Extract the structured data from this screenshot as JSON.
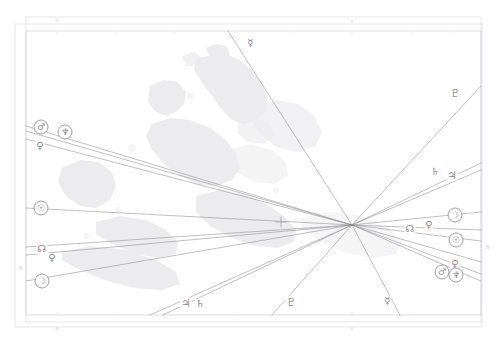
{
  "document": {
    "title": "Astrocartography Map",
    "type": "astro-map",
    "background_color": "#ffffff",
    "line_color": "#8b8b92",
    "land_color": "#ececed",
    "frame_color": "#d9d9de",
    "glyph_color": "#8d8d93"
  },
  "frame": {
    "outer": {
      "x": 15,
      "y": 24,
      "width": 467,
      "height": 303
    },
    "inner": {
      "x": 26,
      "y": 17,
      "width": 455,
      "height": 305
    },
    "map_rect": {
      "x": 26,
      "y": 31,
      "width": 455,
      "height": 284
    }
  },
  "convergence": {
    "label": "line-convergence-point",
    "x": 352,
    "y": 225
  },
  "crosshair": {
    "label": "location-crosshair",
    "x": 281,
    "y": 222,
    "size": 11
  },
  "axis_ticks": {
    "top": [
      {
        "label": "10",
        "x": 57
      },
      {
        "label": "0",
        "x": 352
      }
    ],
    "bottom": [
      {
        "label": "10",
        "x": 57
      },
      {
        "label": "0",
        "x": 352
      }
    ],
    "left": [
      {
        "label": "50",
        "y": 268
      }
    ],
    "right": [
      {
        "label": "50",
        "y": 247
      }
    ]
  },
  "lines": [
    {
      "name": "mars-line-left",
      "glyph": "♂",
      "from": [
        26,
        126
      ],
      "to": [
        352,
        225
      ],
      "style": "solid"
    },
    {
      "name": "neptune-line-left",
      "glyph": "♆",
      "from": [
        26,
        131
      ],
      "to": [
        352,
        225
      ],
      "style": "solid"
    },
    {
      "name": "venus-line-left",
      "glyph": "♀",
      "from": [
        26,
        139
      ],
      "to": [
        352,
        225
      ],
      "style": "solid"
    },
    {
      "name": "sun-line-left",
      "glyph": "☉",
      "from": [
        26,
        208
      ],
      "to": [
        352,
        225
      ],
      "style": "solid"
    },
    {
      "name": "node-line-left",
      "glyph": "☊",
      "from": [
        26,
        247
      ],
      "to": [
        352,
        225
      ],
      "style": "solid"
    },
    {
      "name": "venus-line-left-2",
      "glyph": "♀",
      "from": [
        26,
        255
      ],
      "to": [
        352,
        225
      ],
      "style": "solid"
    },
    {
      "name": "moon-line-left",
      "glyph": "☽",
      "from": [
        26,
        281
      ],
      "to": [
        352,
        225
      ],
      "style": "solid"
    },
    {
      "name": "jupiter-line-bottom",
      "glyph": "♃",
      "from": [
        150,
        315
      ],
      "to": [
        352,
        225
      ],
      "style": "solid"
    },
    {
      "name": "saturn-line-bottom",
      "glyph": "♄",
      "from": [
        163,
        315
      ],
      "to": [
        352,
        225
      ],
      "style": "solid"
    },
    {
      "name": "pluto-line-bottom",
      "glyph": "♇",
      "from": [
        272,
        315
      ],
      "to": [
        352,
        225
      ],
      "style": "solid"
    },
    {
      "name": "mercury-line-bottom",
      "glyph": "☿",
      "from": [
        400,
        315
      ],
      "to": [
        352,
        225
      ],
      "style": "solid"
    },
    {
      "name": "mercury-line-top",
      "glyph": "☿",
      "from": [
        228,
        31
      ],
      "to": [
        352,
        225
      ],
      "style": "solid"
    },
    {
      "name": "pluto-line-right",
      "glyph": "♇",
      "from": [
        481,
        86
      ],
      "to": [
        352,
        225
      ],
      "style": "solid"
    },
    {
      "name": "saturn-line-right",
      "glyph": "♄",
      "from": [
        481,
        163
      ],
      "to": [
        352,
        225
      ],
      "style": "solid"
    },
    {
      "name": "jupiter-line-right",
      "glyph": "♃",
      "from": [
        481,
        170
      ],
      "to": [
        352,
        225
      ],
      "style": "solid"
    },
    {
      "name": "moon-line-right",
      "glyph": "☽",
      "from": [
        481,
        212
      ],
      "to": [
        352,
        225
      ],
      "style": "solid"
    },
    {
      "name": "node-line-right",
      "glyph": "☊",
      "from": [
        481,
        230
      ],
      "to": [
        352,
        225
      ],
      "style": "solid"
    },
    {
      "name": "sun-line-right",
      "glyph": "☉",
      "from": [
        481,
        241
      ],
      "to": [
        352,
        225
      ],
      "style": "solid"
    },
    {
      "name": "venus-line-right",
      "glyph": "♀",
      "from": [
        481,
        262
      ],
      "to": [
        352,
        225
      ],
      "style": "solid"
    },
    {
      "name": "mars-line-right",
      "glyph": "♂",
      "from": [
        481,
        274
      ],
      "to": [
        352,
        225
      ],
      "style": "solid"
    },
    {
      "name": "neptune-line-right",
      "glyph": "♆",
      "from": [
        481,
        281
      ],
      "to": [
        352,
        225
      ],
      "style": "solid"
    }
  ],
  "glyph_markers": [
    {
      "name": "mars-glyph-left",
      "symbol": "♂",
      "x": 41,
      "y": 127,
      "ringed": true,
      "size": "sz-9"
    },
    {
      "name": "neptune-glyph-left",
      "symbol": "♆",
      "x": 65,
      "y": 132,
      "ringed": true,
      "size": "sz-9"
    },
    {
      "name": "venus-glyph-left",
      "symbol": "♀",
      "x": 40,
      "y": 146,
      "ringed": false,
      "size": "sz-10"
    },
    {
      "name": "sun-glyph-left",
      "symbol": "☉",
      "x": 41,
      "y": 208,
      "ringed": true,
      "size": "sz-9"
    },
    {
      "name": "node-glyph-left",
      "symbol": "☊",
      "x": 42,
      "y": 249,
      "ringed": false,
      "size": "sz-10"
    },
    {
      "name": "venus-glyph-left-2",
      "symbol": "♀",
      "x": 52,
      "y": 258,
      "ringed": false,
      "size": "sz-10"
    },
    {
      "name": "moon-glyph-left",
      "symbol": "☽",
      "x": 42,
      "y": 281,
      "ringed": true,
      "size": "sz-9"
    },
    {
      "name": "mercury-glyph-top",
      "symbol": "☿",
      "x": 250,
      "y": 43,
      "ringed": false,
      "size": "sz-10"
    },
    {
      "name": "pluto-glyph-right-top",
      "symbol": "♇",
      "x": 455,
      "y": 93,
      "ringed": false,
      "size": "sz-11"
    },
    {
      "name": "saturn-glyph-right",
      "symbol": "♄",
      "x": 435,
      "y": 172,
      "ringed": false,
      "size": "sz-10"
    },
    {
      "name": "jupiter-glyph-right",
      "symbol": "♃",
      "x": 452,
      "y": 175,
      "ringed": false,
      "size": "sz-11"
    },
    {
      "name": "moon-glyph-right",
      "symbol": "☽",
      "x": 455,
      "y": 215,
      "ringed": true,
      "size": "sz-9"
    },
    {
      "name": "node-glyph-right",
      "symbol": "☊",
      "x": 410,
      "y": 229,
      "ringed": false,
      "size": "sz-10"
    },
    {
      "name": "venus-glyph-right",
      "symbol": "♀",
      "x": 429,
      "y": 225,
      "ringed": false,
      "size": "sz-10"
    },
    {
      "name": "sun-glyph-right",
      "symbol": "☉",
      "x": 456,
      "y": 240,
      "ringed": true,
      "size": "sz-9"
    },
    {
      "name": "venus-glyph-right-2",
      "symbol": "♀",
      "x": 455,
      "y": 264,
      "ringed": false,
      "size": "sz-10"
    },
    {
      "name": "mars-glyph-right",
      "symbol": "♂",
      "x": 442,
      "y": 272,
      "ringed": true,
      "size": "sz-9"
    },
    {
      "name": "neptune-glyph-right",
      "symbol": "♆",
      "x": 456,
      "y": 275,
      "ringed": true,
      "size": "sz-9"
    },
    {
      "name": "jupiter-glyph-bottom",
      "symbol": "♃",
      "x": 186,
      "y": 303,
      "ringed": false,
      "size": "sz-11"
    },
    {
      "name": "saturn-glyph-bottom",
      "symbol": "♄",
      "x": 200,
      "y": 304,
      "ringed": false,
      "size": "sz-10"
    },
    {
      "name": "pluto-glyph-bottom",
      "symbol": "♇",
      "x": 291,
      "y": 302,
      "ringed": false,
      "size": "sz-11"
    },
    {
      "name": "mercury-glyph-bottom",
      "symbol": "☿",
      "x": 387,
      "y": 301,
      "ringed": false,
      "size": "sz-10"
    }
  ],
  "legend": {
    "planets": [
      {
        "name": "Sun",
        "symbol": "☉"
      },
      {
        "name": "Moon",
        "symbol": "☽"
      },
      {
        "name": "Mercury",
        "symbol": "☿"
      },
      {
        "name": "Venus",
        "symbol": "♀"
      },
      {
        "name": "Mars",
        "symbol": "♂"
      },
      {
        "name": "Jupiter",
        "symbol": "♃"
      },
      {
        "name": "Saturn",
        "symbol": "♄"
      },
      {
        "name": "Neptune",
        "symbol": "♆"
      },
      {
        "name": "Pluto",
        "symbol": "♇"
      },
      {
        "name": "North Node",
        "symbol": "☊"
      }
    ]
  }
}
